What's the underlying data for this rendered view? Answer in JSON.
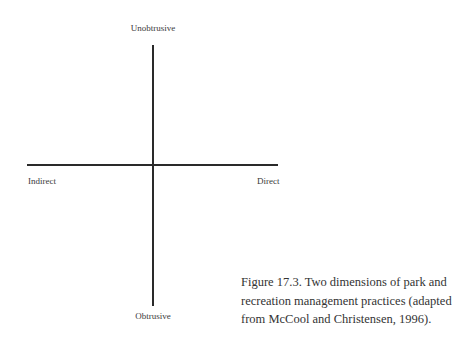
{
  "diagram": {
    "type": "quadrant-axes",
    "axes": {
      "vertical": {
        "top_label": "Unobtrusive",
        "bottom_label": "Obtrusive"
      },
      "horizontal": {
        "left_label": "Indirect",
        "right_label": "Direct"
      }
    },
    "line_color": "#2a2a2a",
    "text_color": "#333333"
  },
  "caption": {
    "lines": [
      "Figure 17.3.  Two dimensions of park and",
      "recreation management practices (adapted",
      "from McCool and Christensen, 1996)."
    ]
  }
}
